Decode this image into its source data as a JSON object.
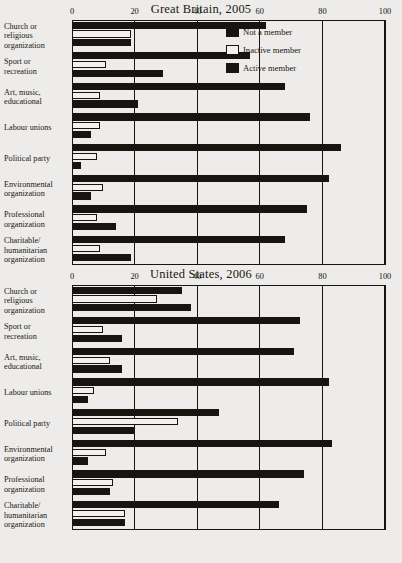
{
  "chart_data": [
    {
      "type": "bar",
      "title": "Great Britain, 2005",
      "orientation": "horizontal",
      "grouped": true,
      "xlabel": "",
      "ylabel": "",
      "xlim": [
        0,
        100
      ],
      "xticks": [
        0,
        20,
        40,
        60,
        80,
        100
      ],
      "grid": true,
      "legend_position": "top-right",
      "categories": [
        "Church or religious organization",
        "Sport or recreation",
        "Art, music, educational",
        "Labour unions",
        "Political party",
        "Environmental organization",
        "Professional organization",
        "Charitable/ humanitarian organization"
      ],
      "series": [
        {
          "name": "Not a member",
          "values": [
            62,
            57,
            68,
            76,
            86,
            82,
            75,
            68
          ]
        },
        {
          "name": "Inactive member",
          "values": [
            19,
            11,
            9,
            9,
            8,
            10,
            8,
            9
          ]
        },
        {
          "name": "Active member",
          "values": [
            19,
            29,
            21,
            6,
            3,
            6,
            14,
            19
          ]
        }
      ]
    },
    {
      "type": "bar",
      "title": "United States, 2006",
      "orientation": "horizontal",
      "grouped": true,
      "xlabel": "",
      "ylabel": "",
      "xlim": [
        0,
        100
      ],
      "xticks": [
        0,
        20,
        40,
        60,
        80,
        100
      ],
      "grid": true,
      "legend_position": "none",
      "categories": [
        "Church or religious organization",
        "Sport or recreation",
        "Art, music, educational",
        "Labour unions",
        "Political party",
        "Environmental organization",
        "Professional organization",
        "Charitable/ humanitarian organization"
      ],
      "series": [
        {
          "name": "Not a member",
          "values": [
            35,
            73,
            71,
            82,
            47,
            83,
            74,
            66
          ]
        },
        {
          "name": "Inactive member",
          "values": [
            27,
            10,
            12,
            7,
            34,
            11,
            13,
            17
          ]
        },
        {
          "name": "Active member",
          "values": [
            38,
            16,
            16,
            5,
            20,
            5,
            12,
            17
          ]
        }
      ]
    }
  ],
  "panels": [
    {
      "title": "Great Britain, 2005",
      "tick_labels": [
        "0",
        "20",
        "40",
        "60",
        "80",
        "100"
      ],
      "category_labels": [
        [
          "Church or",
          "religious",
          "organization"
        ],
        [
          "Sport or",
          "recreation"
        ],
        [
          "Art, music,",
          "educational"
        ],
        [
          "Labour unions"
        ],
        [
          "Political party"
        ],
        [
          "Environmental",
          "organization"
        ],
        [
          "Professional",
          "organization"
        ],
        [
          "Charitable/",
          "humanitarian",
          "organization"
        ]
      ],
      "legend": [
        {
          "label": "Not a member",
          "style": "solid",
          "color": "#17150f"
        },
        {
          "label": "Inactive member",
          "style": "hollow",
          "color": "#ffffff"
        },
        {
          "label": "Active member",
          "style": "solid",
          "color": "#17150f"
        }
      ]
    },
    {
      "title": "United States, 2006",
      "tick_labels": [
        "0",
        "20",
        "40",
        "60",
        "80",
        "100"
      ],
      "category_labels": [
        [
          "Church or",
          "religious",
          "organization"
        ],
        [
          "Sport or",
          "recreation"
        ],
        [
          "Art, music,",
          "educational"
        ],
        [
          "Labour unions"
        ],
        [
          "Political party"
        ],
        [
          "Environmental",
          "organization"
        ],
        [
          "Professional",
          "organization"
        ],
        [
          "Charitable/",
          "humanitarian",
          "organization"
        ]
      ],
      "legend": []
    }
  ],
  "colors": {
    "ink": "#17150f",
    "paper": "#edecea",
    "bar_fill": "#17150f",
    "bar_hollow": "#f2f1ef"
  }
}
